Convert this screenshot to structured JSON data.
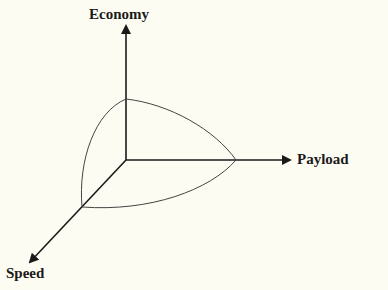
{
  "diagram": {
    "type": "3d-axes-tradeoff",
    "axes": [
      {
        "id": "economy",
        "label": "Economy",
        "direction": "up"
      },
      {
        "id": "payload",
        "label": "Payload",
        "direction": "right"
      },
      {
        "id": "speed",
        "label": "Speed",
        "direction": "down-left"
      }
    ],
    "colors": {
      "background": "#fdfcf2",
      "axis": "#1a1a1a",
      "curve": "#444444"
    }
  }
}
